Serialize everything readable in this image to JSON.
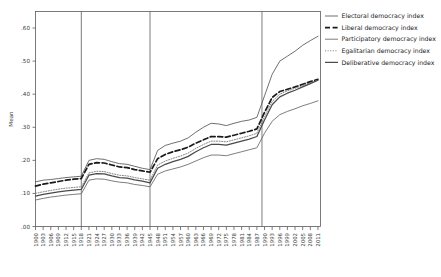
{
  "chart_data": {
    "type": "line",
    "title": "",
    "xlabel": "",
    "ylabel": "Mean",
    "ylim": [
      0.0,
      0.65
    ],
    "xlim": [
      1900,
      2012
    ],
    "grid": false,
    "legend_position": "right",
    "ytick_labels": [
      ".00",
      ".10",
      ".20",
      ".30",
      ".40",
      ".50",
      ".60"
    ],
    "ytick_values": [
      0.0,
      0.1,
      0.2,
      0.3,
      0.4,
      0.5,
      0.6
    ],
    "xtick_labels": [
      "1900",
      "1903",
      "1906",
      "1909",
      "1912",
      "1915",
      "1918",
      "1921",
      "1924",
      "1927",
      "1930",
      "1933",
      "1936",
      "1939",
      "1942",
      "1945",
      "1948",
      "1951",
      "1954",
      "1957",
      "1960",
      "1963",
      "1966",
      "1969",
      "1972",
      "1975",
      "1978",
      "1981",
      "1984",
      "1987",
      "1990",
      "1993",
      "1996",
      "1999",
      "2002",
      "2005",
      "2008",
      "2011"
    ],
    "reference_lines": [
      1918,
      1945,
      1989
    ],
    "x": [
      1900,
      1903,
      1906,
      1909,
      1912,
      1915,
      1918,
      1921,
      1924,
      1927,
      1930,
      1933,
      1936,
      1939,
      1942,
      1945,
      1948,
      1951,
      1954,
      1957,
      1960,
      1963,
      1966,
      1969,
      1972,
      1975,
      1978,
      1981,
      1984,
      1987,
      1990,
      1993,
      1996,
      1999,
      2002,
      2005,
      2008,
      2011
    ],
    "series": [
      {
        "name": "Electoral democracy index",
        "style": "solid-thin",
        "color": "#555555",
        "values": [
          0.135,
          0.14,
          0.142,
          0.145,
          0.148,
          0.15,
          0.152,
          0.2,
          0.205,
          0.203,
          0.196,
          0.19,
          0.188,
          0.182,
          0.176,
          0.172,
          0.23,
          0.245,
          0.252,
          0.258,
          0.268,
          0.285,
          0.3,
          0.312,
          0.31,
          0.305,
          0.312,
          0.318,
          0.322,
          0.33,
          0.395,
          0.46,
          0.5,
          0.515,
          0.53,
          0.548,
          0.562,
          0.575
        ]
      },
      {
        "name": "Liberal democracy index",
        "style": "dashed",
        "color": "#1a1a1a",
        "values": [
          0.122,
          0.128,
          0.132,
          0.136,
          0.14,
          0.143,
          0.145,
          0.188,
          0.193,
          0.192,
          0.186,
          0.18,
          0.178,
          0.172,
          0.168,
          0.164,
          0.205,
          0.218,
          0.226,
          0.232,
          0.24,
          0.252,
          0.262,
          0.272,
          0.272,
          0.27,
          0.276,
          0.282,
          0.288,
          0.295,
          0.345,
          0.39,
          0.408,
          0.415,
          0.422,
          0.43,
          0.438,
          0.445
        ]
      },
      {
        "name": "Participatory democracy index",
        "style": "solid-thin",
        "color": "#666666",
        "values": [
          0.08,
          0.085,
          0.089,
          0.092,
          0.095,
          0.097,
          0.099,
          0.14,
          0.144,
          0.143,
          0.138,
          0.134,
          0.132,
          0.127,
          0.124,
          0.12,
          0.158,
          0.168,
          0.174,
          0.18,
          0.188,
          0.198,
          0.208,
          0.216,
          0.216,
          0.214,
          0.22,
          0.226,
          0.232,
          0.238,
          0.282,
          0.318,
          0.338,
          0.348,
          0.356,
          0.365,
          0.372,
          0.38
        ]
      },
      {
        "name": "Egalitarian democracy index",
        "style": "dotted",
        "color": "#777777",
        "values": [
          0.1,
          0.105,
          0.109,
          0.113,
          0.116,
          0.118,
          0.12,
          0.162,
          0.167,
          0.166,
          0.16,
          0.155,
          0.153,
          0.148,
          0.144,
          0.14,
          0.186,
          0.198,
          0.206,
          0.213,
          0.222,
          0.236,
          0.248,
          0.258,
          0.258,
          0.256,
          0.262,
          0.268,
          0.274,
          0.282,
          0.332,
          0.378,
          0.4,
          0.41,
          0.418,
          0.426,
          0.434,
          0.442
        ]
      },
      {
        "name": "Deliberative democracy index",
        "style": "solid-thick",
        "color": "#4a4a4a",
        "values": [
          0.092,
          0.097,
          0.101,
          0.105,
          0.108,
          0.11,
          0.112,
          0.155,
          0.16,
          0.159,
          0.153,
          0.148,
          0.146,
          0.141,
          0.137,
          0.132,
          0.176,
          0.188,
          0.196,
          0.203,
          0.212,
          0.226,
          0.238,
          0.248,
          0.248,
          0.246,
          0.252,
          0.258,
          0.264,
          0.272,
          0.322,
          0.368,
          0.392,
          0.403,
          0.412,
          0.422,
          0.432,
          0.442
        ]
      }
    ]
  },
  "legend": {
    "items": [
      {
        "label": "Electoral democracy index",
        "swatch": "solid-thin"
      },
      {
        "label": "Liberal democracy index",
        "swatch": "dashed"
      },
      {
        "label": "Participatory democracy index",
        "swatch": "solid-thin"
      },
      {
        "label": "Egalitarian democracy index",
        "swatch": "dotted"
      },
      {
        "label": "Deliberative democracy index",
        "swatch": "solid-thick"
      }
    ]
  }
}
